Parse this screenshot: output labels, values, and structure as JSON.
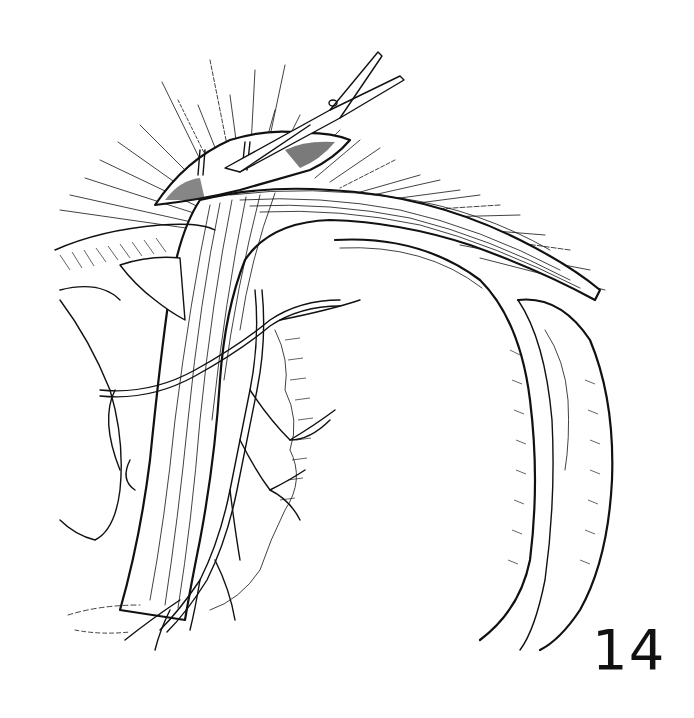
{
  "figure": {
    "number": "14",
    "style": "black ink line art on white"
  },
  "elements": {
    "instrument": "scissors-icon",
    "colors": {
      "ink": "#111111",
      "background": "#ffffff"
    }
  }
}
